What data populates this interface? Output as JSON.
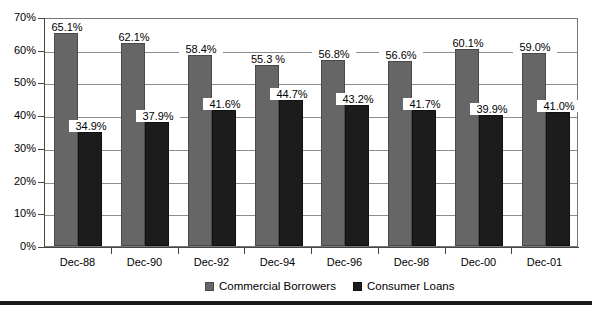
{
  "chart_data": {
    "type": "bar",
    "title": "",
    "subtitle": "",
    "xlabel": "",
    "ylabel": "",
    "ylim": [
      0,
      70
    ],
    "ytick_labels": [
      "0%",
      "10%",
      "20%",
      "30%",
      "40%",
      "50%",
      "60%",
      "70%"
    ],
    "ytick_values": [
      0,
      10,
      20,
      30,
      40,
      50,
      60,
      70
    ],
    "grid": true,
    "grid_axis": "y",
    "legend_position": "bottom-center",
    "categories": [
      "Dec-88",
      "Dec-90",
      "Dec-92",
      "Dec-94",
      "Dec-96",
      "Dec-98",
      "Dec-00",
      "Dec-01"
    ],
    "series": [
      {
        "name": "Commercial Borrowers",
        "color": "#666666",
        "values": [
          65.1,
          62.1,
          58.4,
          55.3,
          56.8,
          56.6,
          60.1,
          59.0
        ],
        "labels": [
          "65.1%",
          "62.1%",
          "58.4%",
          "55.3 %",
          "56.8%",
          "56.6%",
          "60.1%",
          "59.0%"
        ]
      },
      {
        "name": "Consumer Loans",
        "color": "#1c1c1c",
        "values": [
          34.9,
          37.9,
          41.6,
          44.7,
          43.2,
          41.7,
          39.9,
          41.0
        ],
        "labels": [
          "34.9%",
          "37.9%",
          "41.6%",
          "44.7%",
          "43.2%",
          "41.7%",
          "39.9%",
          "41.0%"
        ]
      }
    ]
  },
  "legend": {
    "entries": [
      {
        "label": "Commercial Borrowers",
        "color": "#666666"
      },
      {
        "label": "Consumer Loans",
        "color": "#1c1c1c"
      }
    ]
  },
  "colors": {
    "series_commercial": "#666666",
    "series_consumer": "#1c1c1c",
    "gridline": "#8d8d8d",
    "axis": "#444444",
    "plot_border": "#777777",
    "bottom_rule": "#1a1a1a",
    "background": "#ffffff"
  }
}
